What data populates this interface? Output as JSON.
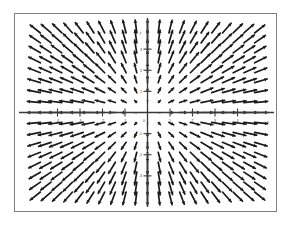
{
  "figure": {
    "background_color": "#ffffff",
    "frame_color": "#808080",
    "ink_color": "#1a1a1a",
    "axis_color": "#3a3a3a",
    "caption": ""
  },
  "chart_data": {
    "type": "scatter",
    "subtype": "quiver-vector-field",
    "title": "",
    "xlabel": "x",
    "ylabel": "y",
    "xlim": [
      -5,
      5
    ],
    "ylim": [
      -4,
      4
    ],
    "grid": false,
    "legend": null,
    "field_formula": {
      "u": "x",
      "v": "y"
    },
    "xticks": [
      -4,
      -3,
      -2,
      -1,
      0,
      1,
      2,
      3,
      4
    ],
    "yticks": [
      -3,
      -2,
      -1,
      0,
      1,
      2,
      3
    ],
    "xtick_labels": [
      "-4",
      "-3",
      "-2",
      "-1",
      "0",
      "1",
      "2",
      "3",
      "4"
    ],
    "ytick_labels": [
      "-3",
      "-2",
      "-1",
      "0",
      "1",
      "2",
      "3"
    ],
    "grid_columns": 21,
    "grid_rows": 17,
    "arrow_scale": 0.115,
    "max_arrow_px": 13,
    "arrowhead_px": 3.2,
    "axis_origin": {
      "x": 0,
      "y": 0
    }
  }
}
